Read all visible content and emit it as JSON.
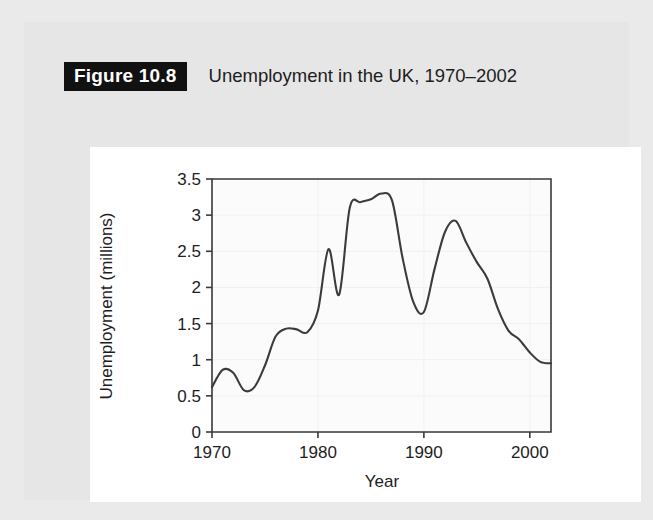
{
  "figure": {
    "badge": "Figure 10.8",
    "title": "Unemployment in the UK, 1970–2002"
  },
  "colors": {
    "page_background": "#eaeaea",
    "card_background": "#e6e6e6",
    "chart_background": "#ffffff",
    "badge_background": "#111111",
    "badge_text": "#ffffff",
    "line": "#3b3b3b",
    "axis": "#3a3a3a",
    "text": "#1d1d1d"
  },
  "chart_data": {
    "type": "line",
    "title": "Unemployment in the UK, 1970–2002",
    "xlabel": "Year",
    "ylabel": "Unemployment (millions)",
    "xlim": [
      1970,
      2002
    ],
    "ylim": [
      0,
      3.5
    ],
    "grid": false,
    "legend": null,
    "x_ticks": [
      1970,
      1980,
      1990,
      2000
    ],
    "x_tick_labels": [
      "1970",
      "1980",
      "1990",
      "2000"
    ],
    "y_ticks": [
      0,
      0.5,
      1,
      1.5,
      2,
      2.5,
      3,
      3.5
    ],
    "y_tick_labels": [
      "0",
      "0.5",
      "1",
      "1.5",
      "2",
      "2.5",
      "3",
      "3.5"
    ],
    "series": [
      {
        "name": "Unemployment (millions)",
        "x": [
          1970,
          1971,
          1972,
          1973,
          1974,
          1975,
          1976,
          1977,
          1978,
          1979,
          1980,
          1981,
          1982,
          1983,
          1984,
          1985,
          1986,
          1987,
          1988,
          1989,
          1990,
          1991,
          1992,
          1993,
          1994,
          1995,
          1996,
          1997,
          1998,
          1999,
          2000,
          2001,
          2002
        ],
        "values": [
          0.62,
          0.86,
          0.82,
          0.58,
          0.62,
          0.92,
          1.32,
          1.43,
          1.42,
          1.38,
          1.68,
          2.53,
          1.9,
          3.1,
          3.18,
          3.22,
          3.3,
          3.2,
          2.4,
          1.8,
          1.66,
          2.25,
          2.77,
          2.92,
          2.62,
          2.35,
          2.12,
          1.7,
          1.4,
          1.28,
          1.1,
          0.97,
          0.95
        ]
      }
    ]
  },
  "axis_labels": {
    "x_title": "Year",
    "y_title": "Unemployment (millions)"
  }
}
